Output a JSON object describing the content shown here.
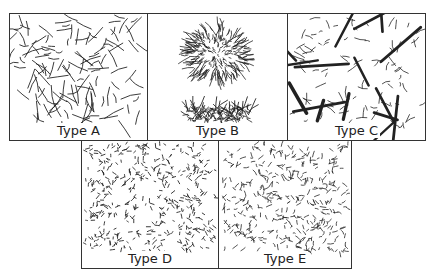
{
  "figure": {
    "panels": [
      {
        "id": "A",
        "label": "Type A",
        "pattern": "uniform-random-flakes"
      },
      {
        "id": "B",
        "label": "Type B",
        "pattern": "rosette-clusters"
      },
      {
        "id": "C",
        "label": "Type C",
        "pattern": "superimposed-large-flakes"
      },
      {
        "id": "D",
        "label": "Type D",
        "pattern": "interdendritic-random"
      },
      {
        "id": "E",
        "label": "Type E",
        "pattern": "interdendritic-preferred-orientation"
      }
    ],
    "colors": {
      "ink": "#222222",
      "border": "#333333",
      "background": "#ffffff"
    }
  }
}
